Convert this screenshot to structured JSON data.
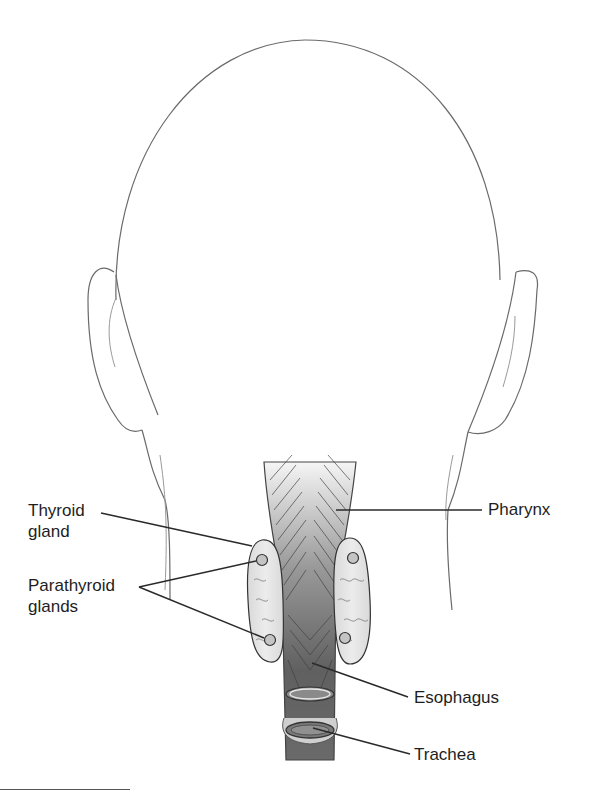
{
  "figure": {
    "colors": {
      "outline": "#6a6a6a",
      "leader_line": "#2a2a2a",
      "gland_fill": "#e4e4e4",
      "pharynx_top": "#f2f2f2",
      "pharynx_bottom": "#5a5a5a"
    }
  },
  "labels": {
    "thyroid": "Thyroid\ngland",
    "parathyroid": "Parathyroid\nglands",
    "pharynx": "Pharynx",
    "esophagus": "Esophagus",
    "trachea": "Trachea"
  }
}
